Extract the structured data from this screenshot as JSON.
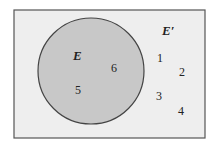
{
  "diagram": {
    "type": "venn",
    "universe": {
      "fill": "#eeeeee",
      "stroke": "#555555"
    },
    "set_E": {
      "label": "E",
      "fill": "#c8c8c8",
      "stroke": "#444444",
      "elements": [
        "5",
        "6"
      ]
    },
    "complement": {
      "label": "E′",
      "elements": [
        "1",
        "2",
        "3",
        "4"
      ]
    },
    "labels": {
      "E": "E",
      "E_prime": "E′",
      "n1": "1",
      "n2": "2",
      "n3": "3",
      "n4": "4",
      "n5": "5",
      "n6": "6"
    }
  }
}
